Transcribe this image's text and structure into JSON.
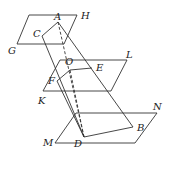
{
  "diagram": {
    "planes": [
      {
        "name": "GH",
        "points": [
          [
            29,
            15
          ],
          [
            77,
            15
          ],
          [
            64,
            44
          ],
          [
            17,
            44
          ]
        ]
      },
      {
        "name": "KL",
        "points": [
          [
            60,
            60
          ],
          [
            127,
            60
          ],
          [
            111,
            91
          ],
          [
            43,
            91
          ]
        ]
      },
      {
        "name": "MN",
        "points": [
          [
            76,
            113
          ],
          [
            157,
            113
          ],
          [
            135,
            143
          ],
          [
            55,
            143
          ]
        ]
      }
    ],
    "points": {
      "A": [
        58,
        22
      ],
      "C": [
        42,
        36
      ],
      "O": [
        70,
        70
      ],
      "E": [
        92,
        68
      ],
      "F": [
        57,
        81
      ],
      "D": [
        84,
        137
      ],
      "B": [
        133,
        127
      ]
    },
    "labels": [
      {
        "text": "A",
        "x": 54,
        "y": 20
      },
      {
        "text": "H",
        "x": 81,
        "y": 19
      },
      {
        "text": "C",
        "x": 33,
        "y": 37
      },
      {
        "text": "G",
        "x": 8,
        "y": 54
      },
      {
        "text": "L",
        "x": 126,
        "y": 58
      },
      {
        "text": "O",
        "x": 65,
        "y": 65
      },
      {
        "text": "E",
        "x": 96,
        "y": 71
      },
      {
        "text": "F",
        "x": 48,
        "y": 84
      },
      {
        "text": "K",
        "x": 38,
        "y": 104
      },
      {
        "text": "N",
        "x": 153,
        "y": 110
      },
      {
        "text": "B",
        "x": 137,
        "y": 131
      },
      {
        "text": "M",
        "x": 43,
        "y": 146
      },
      {
        "text": "D",
        "x": 74,
        "y": 147
      }
    ],
    "solid_segments": [
      [
        "C",
        "A"
      ],
      [
        "A",
        "B"
      ],
      [
        "C",
        "D"
      ],
      [
        "D",
        "B"
      ],
      [
        "F",
        "O"
      ],
      [
        "O",
        "E"
      ],
      [
        "F",
        "D"
      ]
    ],
    "dashed_segments": [
      [
        "A",
        "D"
      ],
      [
        "O",
        "D"
      ]
    ]
  }
}
